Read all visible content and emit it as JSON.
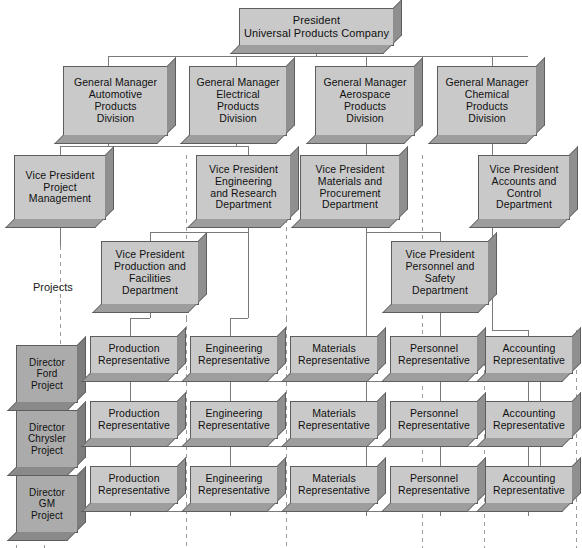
{
  "diagram": {
    "title_label": "Projects",
    "colors": {
      "box_fill": "#c9c9c9",
      "box_fill_dark": "#ababab",
      "box_edge": "#5d5d5d",
      "solid_line": "#7a7a7a",
      "dashed_line": "#9a9a9a",
      "text": "#101010"
    }
  },
  "president": {
    "line1": "President",
    "line2": "Universal Products Company"
  },
  "general_managers": [
    {
      "line1": "General Manager",
      "line2": "Automotive",
      "line3": "Products",
      "line4": "Division"
    },
    {
      "line1": "General Manager",
      "line2": "Electrical",
      "line3": "Products",
      "line4": "Division"
    },
    {
      "line1": "General Manager",
      "line2": "Aerospace",
      "line3": "Products",
      "line4": "Division"
    },
    {
      "line1": "General Manager",
      "line2": "Chemical",
      "line3": "Products",
      "line4": "Division"
    }
  ],
  "vice_presidents_row1": [
    {
      "line1": "Vice President",
      "line2": "Project",
      "line3": "Management",
      "line4": ""
    },
    {
      "line1": "Vice President",
      "line2": "Engineering",
      "line3": "and Research",
      "line4": "Department"
    },
    {
      "line1": "Vice President",
      "line2": "Materials and",
      "line3": "Procurement",
      "line4": "Department"
    },
    {
      "line1": "Vice President",
      "line2": "Accounts and",
      "line3": "Control",
      "line4": "Department"
    }
  ],
  "vice_presidents_row2": [
    {
      "line1": "Vice President",
      "line2": "Production and",
      "line3": "Facilities",
      "line4": "Department"
    },
    {
      "line1": "Vice President",
      "line2": "Personnel and",
      "line3": "Safety",
      "line4": "Department"
    }
  ],
  "directors": [
    {
      "line1": "Director",
      "line2": "Ford",
      "line3": "Project"
    },
    {
      "line1": "Director",
      "line2": "Chrysler",
      "line3": "Project"
    },
    {
      "line1": "Director",
      "line2": "GM",
      "line3": "Project"
    }
  ],
  "representatives": {
    "columns": [
      "Production",
      "Engineering",
      "Materials",
      "Personnel",
      "Accounting"
    ],
    "suffix": "Representative",
    "rows": [
      [
        {
          "line1": "Production",
          "line2": "Representative"
        },
        {
          "line1": "Engineering",
          "line2": "Representative"
        },
        {
          "line1": "Materials",
          "line2": "Representative"
        },
        {
          "line1": "Personnel",
          "line2": "Representative"
        },
        {
          "line1": "Accounting",
          "line2": "Representative"
        }
      ],
      [
        {
          "line1": "Production",
          "line2": "Representative"
        },
        {
          "line1": "Engineering",
          "line2": "Representative"
        },
        {
          "line1": "Materials",
          "line2": "Representative"
        },
        {
          "line1": "Personnel",
          "line2": "Representative"
        },
        {
          "line1": "Accounting",
          "line2": "Representative"
        }
      ],
      [
        {
          "line1": "Production",
          "line2": "Representative"
        },
        {
          "line1": "Engineering",
          "line2": "Representative"
        },
        {
          "line1": "Materials",
          "line2": "Representative"
        },
        {
          "line1": "Personnel",
          "line2": "Representative"
        },
        {
          "line1": "Accounting",
          "line2": "Representative"
        }
      ]
    ]
  }
}
